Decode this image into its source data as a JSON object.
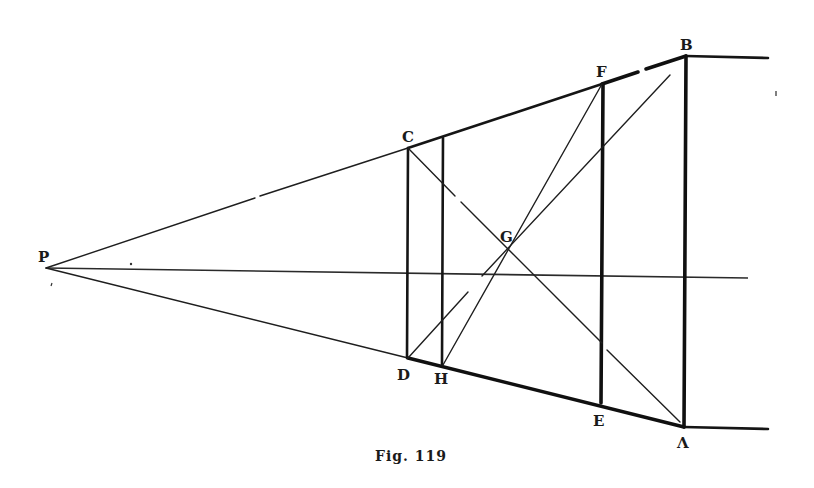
{
  "figure": {
    "caption": "Fig. 119",
    "caption_as_printed": "Fig. 119",
    "points": {
      "P": {
        "label": "P",
        "x": 46,
        "y": 268
      },
      "C": {
        "label": "C",
        "x": 408,
        "y": 148
      },
      "D": {
        "label": "D",
        "x": 408,
        "y": 358
      },
      "H": {
        "label": "H",
        "x": 443,
        "y": 365
      },
      "G": {
        "label": "G",
        "x": 508,
        "y": 248
      },
      "F": {
        "label": "F",
        "x": 602,
        "y": 84
      },
      "E": {
        "label": "E",
        "x": 602,
        "y": 403
      },
      "B": {
        "label": "B",
        "x": 686,
        "y": 56
      },
      "A": {
        "label": "A",
        "x": 684,
        "y": 427
      }
    },
    "labels": {
      "P": "P",
      "C": "C",
      "D": "D",
      "H": "H",
      "G": "G",
      "F": "F",
      "E": "E",
      "B": "B",
      "A": "Λ"
    },
    "segments": [
      {
        "from": "P",
        "to": "B",
        "style": "upper converging line (thin to C, thick C-B, gap near B)"
      },
      {
        "from": "P",
        "to": "A",
        "style": "lower converging line (thin to D, thick D-A)"
      },
      {
        "from": "P",
        "to": "axis-end",
        "style": "horizontal axis"
      },
      {
        "from": "C",
        "to": "D",
        "style": "vertical"
      },
      {
        "from": "H-top",
        "to": "H",
        "style": "vertical"
      },
      {
        "from": "F",
        "to": "E",
        "style": "vertical"
      },
      {
        "from": "B",
        "to": "A",
        "style": "vertical thick"
      },
      {
        "from": "C",
        "to": "A",
        "style": "diagonal through G"
      },
      {
        "from": "H",
        "to": "F",
        "style": "diagonal through G"
      },
      {
        "from": "D",
        "to": "B",
        "style": "diagonal toward B through G"
      },
      {
        "from": "B",
        "to": "right",
        "style": "horizontal extension"
      },
      {
        "from": "A",
        "to": "right",
        "style": "horizontal extension"
      }
    ]
  }
}
